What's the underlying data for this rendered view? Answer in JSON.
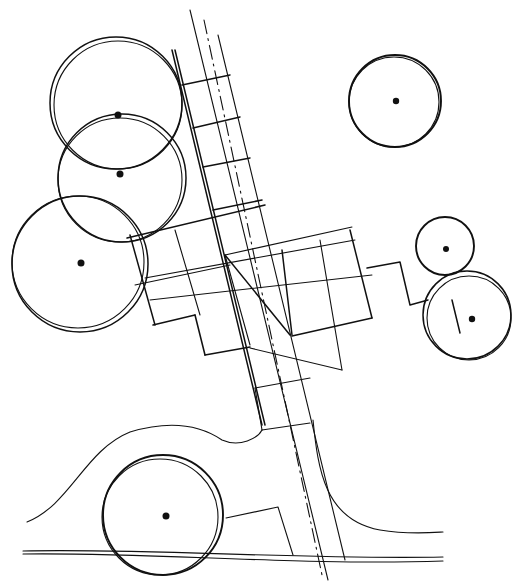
{
  "diagram": {
    "type": "hand-drawn site plan sketch",
    "background": "#ffffff",
    "ink_color": "#111111",
    "trees": [
      {
        "id": "tree-1",
        "cx": 116,
        "cy": 103,
        "r": 66
      },
      {
        "id": "tree-2",
        "cx": 122,
        "cy": 178,
        "r": 64
      },
      {
        "id": "tree-3",
        "cx": 80,
        "cy": 264,
        "r": 68
      },
      {
        "id": "tree-4",
        "cx": 395,
        "cy": 101,
        "r": 46
      },
      {
        "id": "tree-5",
        "cx": 445,
        "cy": 246,
        "r": 29
      },
      {
        "id": "tree-6",
        "cx": 467,
        "cy": 315,
        "r": 44
      },
      {
        "id": "tree-7",
        "cx": 165,
        "cy": 515,
        "r": 60
      }
    ],
    "elements": [
      "central dash-dot axis line",
      "paved walkway grid",
      "cross-shaped paved plaza",
      "curved path edge",
      "road edge double line",
      "stepped connector paths"
    ]
  }
}
